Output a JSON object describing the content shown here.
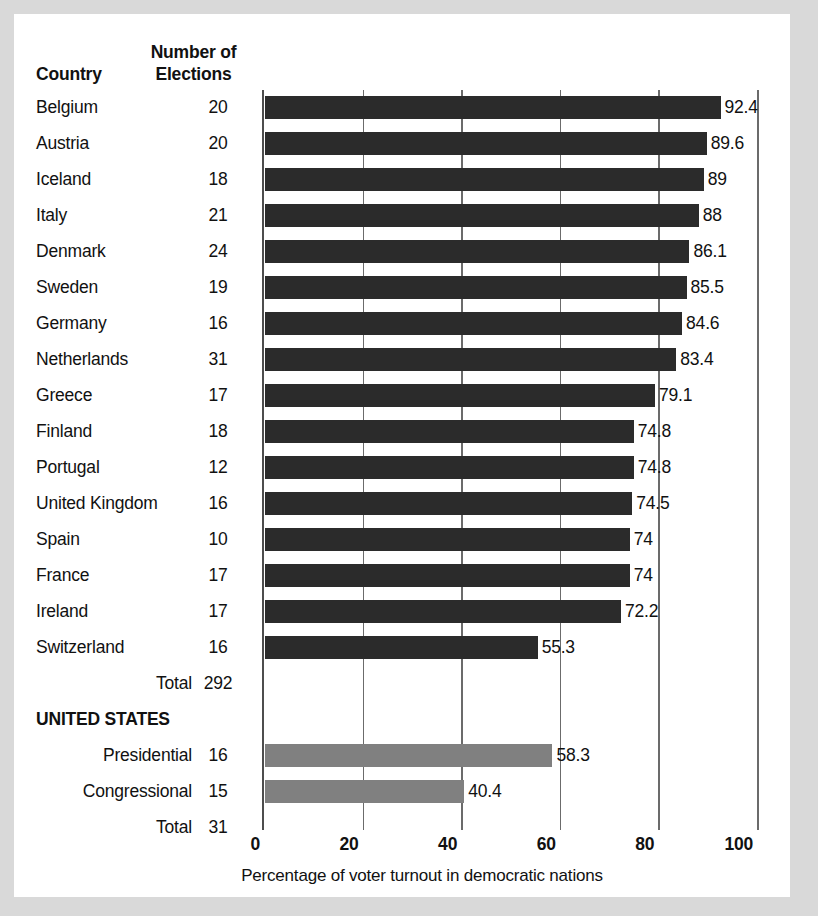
{
  "table": {
    "headers": {
      "country": "Country",
      "elections_line1": "Number of",
      "elections_line2": "Elections"
    },
    "rows": [
      {
        "label": "Belgium",
        "elections": "20",
        "align": "left",
        "bold": false,
        "value": 92.4,
        "value_label": "92.4",
        "color": "dark"
      },
      {
        "label": "Austria",
        "elections": "20",
        "align": "left",
        "bold": false,
        "value": 89.6,
        "value_label": "89.6",
        "color": "dark"
      },
      {
        "label": "Iceland",
        "elections": "18",
        "align": "left",
        "bold": false,
        "value": 89,
        "value_label": "89",
        "color": "dark"
      },
      {
        "label": "Italy",
        "elections": "21",
        "align": "left",
        "bold": false,
        "value": 88,
        "value_label": "88",
        "color": "dark"
      },
      {
        "label": "Denmark",
        "elections": "24",
        "align": "left",
        "bold": false,
        "value": 86.1,
        "value_label": "86.1",
        "color": "dark"
      },
      {
        "label": "Sweden",
        "elections": "19",
        "align": "left",
        "bold": false,
        "value": 85.5,
        "value_label": "85.5",
        "color": "dark"
      },
      {
        "label": "Germany",
        "elections": "16",
        "align": "left",
        "bold": false,
        "value": 84.6,
        "value_label": "84.6",
        "color": "dark"
      },
      {
        "label": "Netherlands",
        "elections": "31",
        "align": "left",
        "bold": false,
        "value": 83.4,
        "value_label": "83.4",
        "color": "dark"
      },
      {
        "label": "Greece",
        "elections": "17",
        "align": "left",
        "bold": false,
        "value": 79.1,
        "value_label": "79.1",
        "color": "dark"
      },
      {
        "label": "Finland",
        "elections": "18",
        "align": "left",
        "bold": false,
        "value": 74.8,
        "value_label": "74.8",
        "color": "dark"
      },
      {
        "label": "Portugal",
        "elections": "12",
        "align": "left",
        "bold": false,
        "value": 74.8,
        "value_label": "74.8",
        "color": "dark"
      },
      {
        "label": "United Kingdom",
        "elections": "16",
        "align": "left",
        "bold": false,
        "value": 74.5,
        "value_label": "74.5",
        "color": "dark"
      },
      {
        "label": "Spain",
        "elections": "10",
        "align": "left",
        "bold": false,
        "value": 74,
        "value_label": "74",
        "color": "dark"
      },
      {
        "label": "France",
        "elections": "17",
        "align": "left",
        "bold": false,
        "value": 74,
        "value_label": "74",
        "color": "dark"
      },
      {
        "label": "Ireland",
        "elections": "17",
        "align": "left",
        "bold": false,
        "value": 72.2,
        "value_label": "72.2",
        "color": "dark"
      },
      {
        "label": "Switzerland",
        "elections": "16",
        "align": "left",
        "bold": false,
        "value": 55.3,
        "value_label": "55.3",
        "color": "dark"
      },
      {
        "label": "Total",
        "elections": "292",
        "align": "right",
        "bold": false,
        "value": null,
        "value_label": "",
        "color": "none"
      },
      {
        "label": "UNITED STATES",
        "elections": "",
        "align": "left",
        "bold": true,
        "value": null,
        "value_label": "",
        "color": "none"
      },
      {
        "label": "Presidential",
        "elections": "16",
        "align": "right",
        "bold": false,
        "value": 58.3,
        "value_label": "58.3",
        "color": "gray"
      },
      {
        "label": "Congressional",
        "elections": "15",
        "align": "right",
        "bold": false,
        "value": 40.4,
        "value_label": "40.4",
        "color": "gray"
      },
      {
        "label": "Total",
        "elections": "31",
        "align": "right",
        "bold": false,
        "value": null,
        "value_label": "",
        "color": "none"
      }
    ]
  },
  "chart_data": {
    "type": "bar",
    "orientation": "horizontal",
    "title": "",
    "xlabel": "Percentage of voter turnout in democratic nations",
    "ylabel": "",
    "xlim": [
      0,
      100
    ],
    "xticks": [
      "0",
      "20",
      "40",
      "60",
      "80",
      "100"
    ],
    "xtick_values": [
      0,
      20,
      40,
      60,
      80,
      100
    ],
    "grid": true,
    "legend": "none",
    "categories": [
      "Belgium",
      "Austria",
      "Iceland",
      "Italy",
      "Denmark",
      "Sweden",
      "Germany",
      "Netherlands",
      "Greece",
      "Finland",
      "Portugal",
      "United Kingdom",
      "Spain",
      "France",
      "Ireland",
      "Switzerland",
      "United States Presidential",
      "United States Congressional"
    ],
    "values": [
      92.4,
      89.6,
      89,
      88,
      86.1,
      85.5,
      84.6,
      83.4,
      79.1,
      74.8,
      74.8,
      74.5,
      74,
      74,
      72.2,
      55.3,
      58.3,
      40.4
    ],
    "number_of_elections": [
      20,
      20,
      18,
      21,
      24,
      19,
      16,
      31,
      17,
      18,
      12,
      16,
      10,
      17,
      17,
      16,
      16,
      15
    ],
    "totals": {
      "other_nations_elections": 292,
      "united_states_elections": 31
    },
    "colors": {
      "dark": "#2b2b2b",
      "gray": "#808080"
    }
  }
}
